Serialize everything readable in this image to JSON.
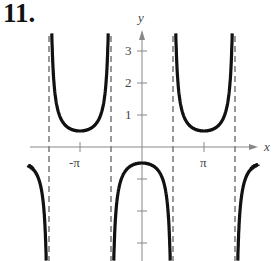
{
  "problem_label": "11.",
  "chart_data": {
    "type": "line",
    "title": "",
    "function": "y = -(1/2) sec x",
    "xlabel": "x",
    "ylabel": "y",
    "x_ticks": [
      "-π",
      "π"
    ],
    "y_ticks": [
      "1",
      "2",
      "3"
    ],
    "asymptotes": [
      "-3π/2",
      "-π/2",
      "π/2",
      "3π/2"
    ],
    "xlim": [
      "-2π",
      "2π"
    ],
    "ylim": [
      -3.6,
      3.6
    ],
    "key_points": [
      {
        "x": "-π",
        "y": 0.5
      },
      {
        "x": "0",
        "y": -0.5
      },
      {
        "x": "π",
        "y": 0.5
      }
    ],
    "grid": false
  }
}
